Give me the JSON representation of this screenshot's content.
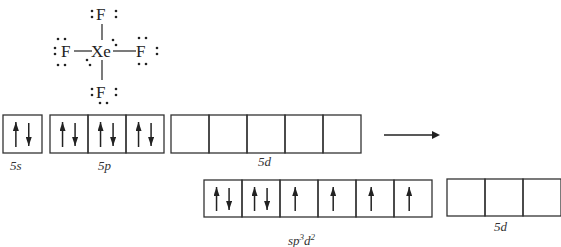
{
  "lewis": {
    "center": "Xe",
    "ligands": [
      "F",
      "F",
      "F",
      "F"
    ],
    "ligand_positions": [
      "top",
      "left",
      "right",
      "bottom"
    ],
    "lone_pairs_on_center": 2
  },
  "ground_state": {
    "orbitals": [
      {
        "label": "5s",
        "boxes": [
          [
            "up",
            "down"
          ]
        ]
      },
      {
        "label": "5p",
        "boxes": [
          [
            "up",
            "down"
          ],
          [
            "up",
            "down"
          ],
          [
            "up",
            "down"
          ]
        ]
      },
      {
        "label": "5d",
        "boxes": [
          [],
          [],
          [],
          [],
          []
        ]
      }
    ]
  },
  "transition_arrow": "right-arrow",
  "hybrid_state": {
    "orbitals": [
      {
        "label": "sp³d²",
        "label_base": "sp",
        "sup1": "3",
        "mid": "d",
        "sup2": "2",
        "boxes": [
          [
            "up",
            "down"
          ],
          [
            "up",
            "down"
          ],
          [
            "up"
          ],
          [
            "up"
          ],
          [
            "up"
          ],
          [
            "up"
          ]
        ]
      },
      {
        "label": "5d",
        "boxes": [
          [],
          [],
          []
        ]
      }
    ]
  }
}
